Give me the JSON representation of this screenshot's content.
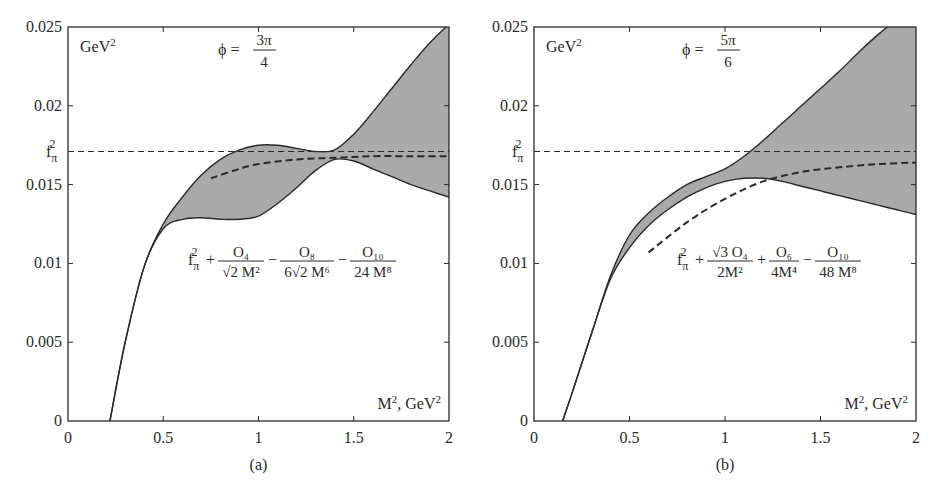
{
  "figure": {
    "panels": [
      {
        "id": "a",
        "caption": "(a)",
        "y_unit_label": "GeV²",
        "x_unit_label": "M², GeV²",
        "phi_label": "ϕ =",
        "phi_num": "3π",
        "phi_den": "4",
        "formula": {
          "lead": "f",
          "lead_sub": "π",
          "lead_sup": "2",
          "terms": [
            {
              "sign": "+",
              "num": "O₄",
              "den": "√2 M²"
            },
            {
              "sign": "−",
              "num": "O₈",
              "den": "6√2 M⁶"
            },
            {
              "sign": "−",
              "num": "O₁₀",
              "den": "24 M⁸"
            }
          ]
        }
      },
      {
        "id": "b",
        "caption": "(b)",
        "y_unit_label": "GeV²",
        "x_unit_label": "M², GeV²",
        "phi_label": "ϕ =",
        "phi_num": "5π",
        "phi_den": "6",
        "formula": {
          "lead": "f",
          "lead_sub": "π",
          "lead_sup": "2",
          "terms": [
            {
              "sign": "+",
              "num": "√3 O₄",
              "den": "2M²"
            },
            {
              "sign": "+",
              "num": "O₆",
              "den": "4M⁴"
            },
            {
              "sign": "−",
              "num": "O₁₀",
              "den": "48 M⁸"
            }
          ]
        }
      }
    ],
    "y_ticks": [
      "0",
      "0.005",
      "0.01",
      "0.015",
      "0.02",
      "0.025"
    ],
    "x_ticks": [
      "0",
      "0.5",
      "1",
      "1.5",
      "2"
    ],
    "fpi_label": {
      "base": "f",
      "sub": "π",
      "sup": "2"
    },
    "colors": {
      "band": "#a9a9a9",
      "line": "#2a2a2a",
      "background": "#ffffff"
    }
  },
  "chart_data": [
    {
      "type": "area",
      "title": "ϕ = 3π/4",
      "panel": "(a)",
      "xlabel": "M², GeV²",
      "ylabel": "GeV²",
      "xlim": [
        0,
        2
      ],
      "ylim": [
        0,
        0.025
      ],
      "grid": false,
      "reference_line": {
        "name": "f_π²",
        "y": 0.0171,
        "style": "dashed"
      },
      "x": [
        0.22,
        0.3,
        0.4,
        0.5,
        0.6,
        0.7,
        0.8,
        0.9,
        1.0,
        1.1,
        1.2,
        1.3,
        1.4,
        1.5,
        1.6,
        1.7,
        1.8,
        1.9,
        2.0
      ],
      "series": [
        {
          "name": "band upper",
          "values": [
            0.0,
            0.005,
            0.0098,
            0.0125,
            0.0142,
            0.0156,
            0.0166,
            0.0172,
            0.0175,
            0.0175,
            0.0173,
            0.0171,
            0.0172,
            0.0182,
            0.0196,
            0.0211,
            0.0226,
            0.024,
            0.0252
          ]
        },
        {
          "name": "band lower",
          "values": [
            0.0,
            0.005,
            0.0098,
            0.0122,
            0.0128,
            0.0129,
            0.0128,
            0.0128,
            0.013,
            0.0138,
            0.0148,
            0.0159,
            0.0166,
            0.0165,
            0.016,
            0.0155,
            0.015,
            0.0146,
            0.0142
          ]
        },
        {
          "name": "f_π² + O₄/(√2M²) − O₈/(6√2M⁶) − O₁₀/(24M⁸)",
          "style": "dashed",
          "x": [
            0.75,
            0.9,
            1.0,
            1.2,
            1.4,
            1.6,
            1.8,
            2.0
          ],
          "values": [
            0.0154,
            0.016,
            0.0163,
            0.0166,
            0.0167,
            0.0168,
            0.0168,
            0.0168
          ]
        }
      ]
    },
    {
      "type": "area",
      "title": "ϕ = 5π/6",
      "panel": "(b)",
      "xlabel": "M², GeV²",
      "ylabel": "GeV²",
      "xlim": [
        0,
        2
      ],
      "ylim": [
        0,
        0.025
      ],
      "grid": false,
      "reference_line": {
        "name": "f_π²",
        "y": 0.0171,
        "style": "dashed"
      },
      "x": [
        0.15,
        0.2,
        0.3,
        0.4,
        0.5,
        0.6,
        0.7,
        0.8,
        0.9,
        1.0,
        1.1,
        1.2,
        1.3,
        1.4,
        1.5,
        1.6,
        1.7,
        1.8,
        1.9,
        2.0
      ],
      "series": [
        {
          "name": "band upper",
          "values": [
            0.0,
            0.0018,
            0.0055,
            0.0092,
            0.0118,
            0.0132,
            0.0142,
            0.015,
            0.0155,
            0.016,
            0.0168,
            0.0178,
            0.0189,
            0.02,
            0.0211,
            0.0222,
            0.0234,
            0.0245,
            0.0255,
            0.0265
          ]
        },
        {
          "name": "band lower",
          "values": [
            0.0,
            0.0018,
            0.0055,
            0.009,
            0.011,
            0.0124,
            0.0134,
            0.0142,
            0.0148,
            0.0152,
            0.0154,
            0.0154,
            0.0152,
            0.0149,
            0.0146,
            0.0143,
            0.014,
            0.0137,
            0.0134,
            0.0131
          ]
        },
        {
          "name": "f_π² + √3O₄/(2M²) + O₆/(4M⁴) − O₁₀/(48M⁸)",
          "style": "dashed",
          "x": [
            0.6,
            0.8,
            1.0,
            1.2,
            1.4,
            1.6,
            1.8,
            2.0
          ],
          "values": [
            0.0107,
            0.0126,
            0.0141,
            0.0152,
            0.0158,
            0.0161,
            0.0163,
            0.0164
          ]
        }
      ]
    }
  ]
}
